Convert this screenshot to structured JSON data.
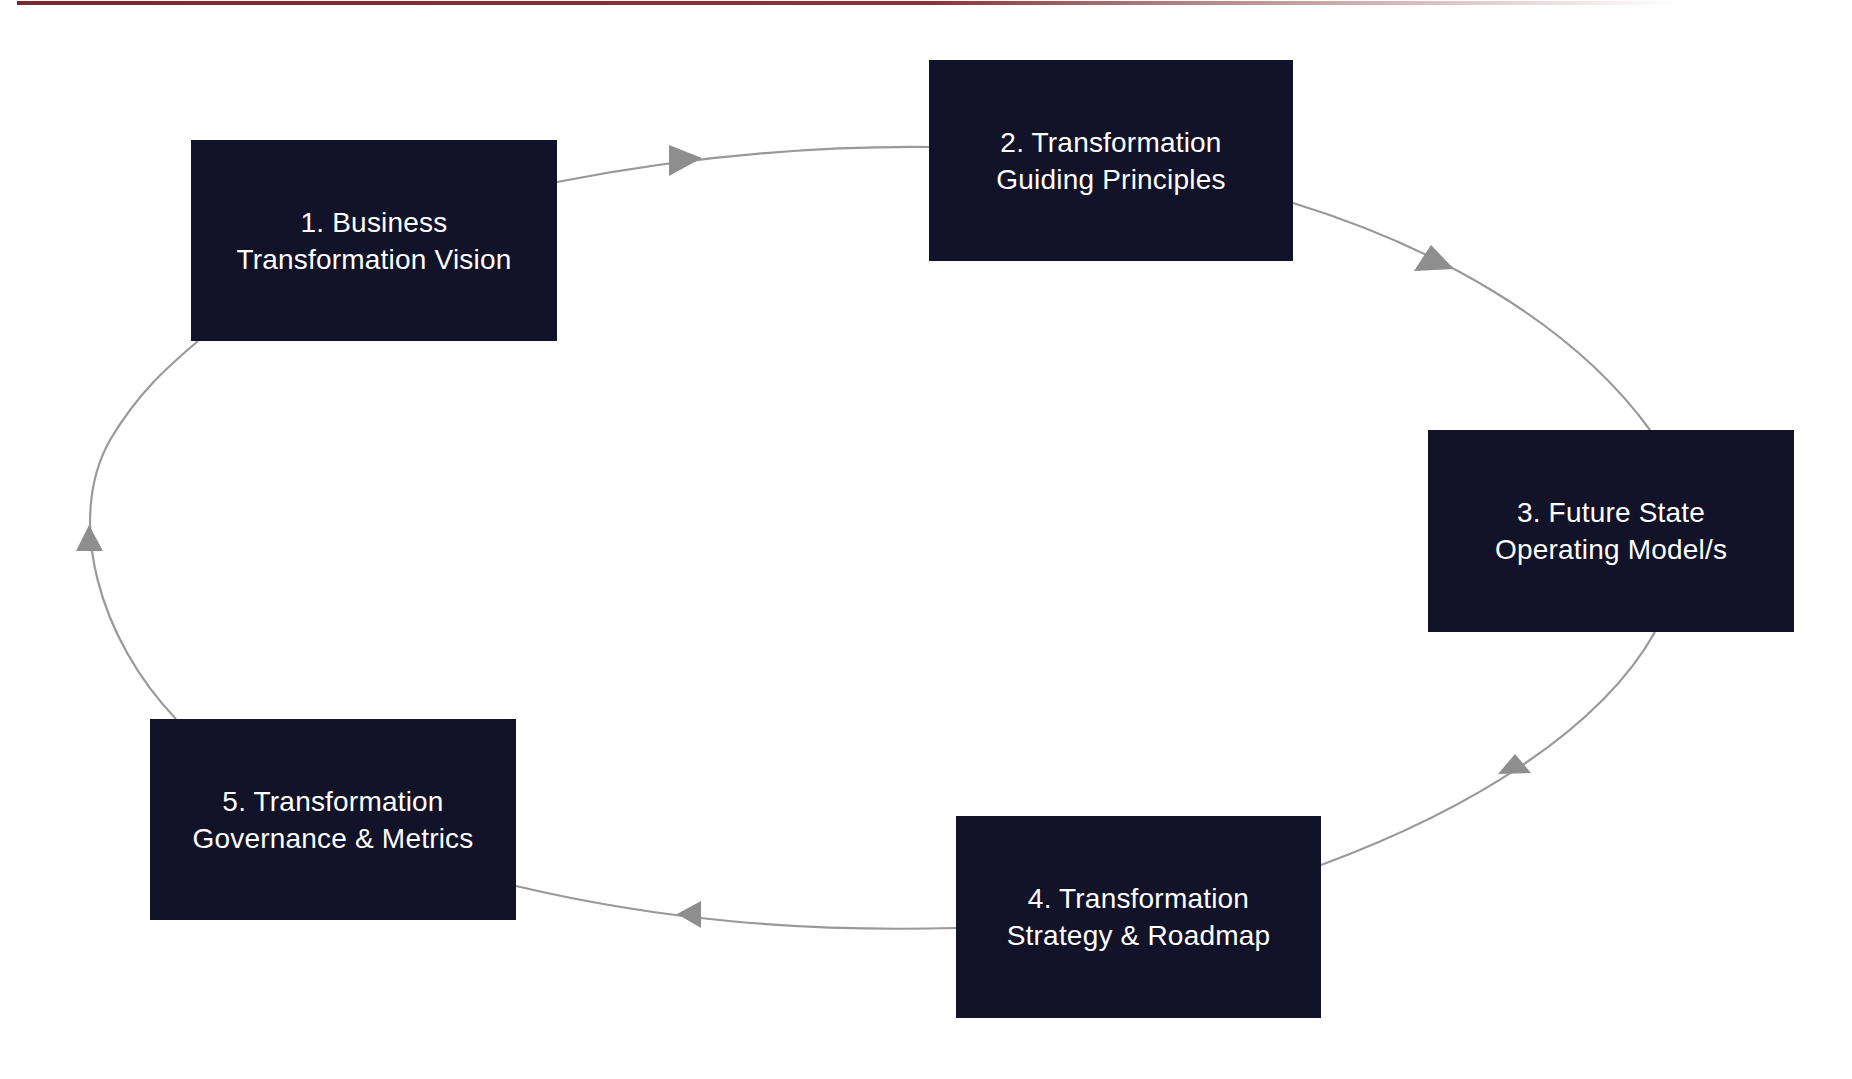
{
  "diagram": {
    "type": "cycle",
    "direction": "clockwise",
    "colors": {
      "box_fill": "#121229",
      "box_text": "#ffffff",
      "connector": "#999999",
      "top_rule": "#7a2a2a"
    },
    "steps": [
      {
        "id": 1,
        "line1": "1. Business",
        "line2": "Transformation Vision"
      },
      {
        "id": 2,
        "line1": "2. Transformation",
        "line2": "Guiding Principles"
      },
      {
        "id": 3,
        "line1": "3. Future State",
        "line2": "Operating Model/s"
      },
      {
        "id": 4,
        "line1": "4. Transformation",
        "line2": "Strategy & Roadmap"
      },
      {
        "id": 5,
        "line1": "5. Transformation",
        "line2": "Governance & Metrics"
      }
    ],
    "edges": [
      {
        "from": 1,
        "to": 2
      },
      {
        "from": 2,
        "to": 3
      },
      {
        "from": 3,
        "to": 4
      },
      {
        "from": 4,
        "to": 5
      },
      {
        "from": 5,
        "to": 1
      }
    ]
  }
}
